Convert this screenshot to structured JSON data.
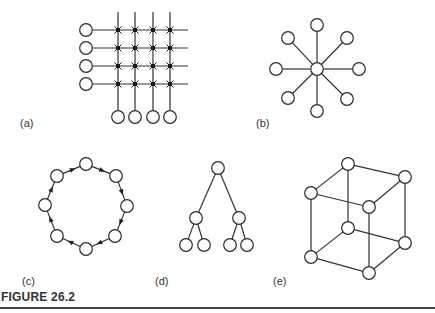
{
  "figure": {
    "caption": "FIGURE 26.2",
    "cutoff_text": "",
    "panels": [
      {
        "id": "a",
        "label": "(a)",
        "type": "crossbar-switch",
        "rows": 4,
        "columns": 4
      },
      {
        "id": "b",
        "label": "(b)",
        "type": "star",
        "outer_nodes": 8
      },
      {
        "id": "c",
        "label": "(c)",
        "type": "ring",
        "nodes": 8,
        "direction": "clockwise"
      },
      {
        "id": "d",
        "label": "(d)",
        "type": "binary-tree",
        "levels": 3,
        "nodes": 7
      },
      {
        "id": "e",
        "label": "(e)",
        "type": "hypercube",
        "dimension": 3,
        "nodes": 8
      }
    ]
  },
  "geometry": {
    "crossbar": {
      "row_y": [
        30,
        48,
        66,
        84
      ],
      "col_x": [
        118,
        135,
        153,
        170
      ],
      "left_node_x": 86,
      "bottom_node_y": 117,
      "line_top": 12,
      "line_right": 188
    },
    "star": {
      "center": [
        317,
        69
      ],
      "outer": [
        [
          317,
          25
        ],
        [
          347,
          38
        ],
        [
          359,
          69
        ],
        [
          347,
          99
        ],
        [
          317,
          111
        ],
        [
          288,
          98
        ],
        [
          276,
          69
        ],
        [
          288,
          38
        ]
      ]
    },
    "ring": {
      "nodes": [
        [
          86,
          164
        ],
        [
          116,
          176
        ],
        [
          127,
          206
        ],
        [
          115,
          236
        ],
        [
          86,
          249
        ],
        [
          57,
          236
        ],
        [
          45,
          205
        ],
        [
          57,
          176
        ]
      ]
    },
    "tree": {
      "nodes": [
        [
          218,
          168
        ],
        [
          196,
          218
        ],
        [
          239,
          218
        ],
        [
          186,
          245
        ],
        [
          204,
          245
        ],
        [
          230,
          245
        ],
        [
          247,
          245
        ]
      ],
      "edges": [
        [
          0,
          1
        ],
        [
          0,
          2
        ],
        [
          1,
          3
        ],
        [
          1,
          4
        ],
        [
          2,
          5
        ],
        [
          2,
          6
        ]
      ]
    },
    "cube": {
      "nodes": [
        [
          348,
          164
        ],
        [
          405,
          177
        ],
        [
          311,
          193
        ],
        [
          369,
          207
        ],
        [
          348,
          228
        ],
        [
          405,
          243
        ],
        [
          311,
          257
        ],
        [
          369,
          273
        ]
      ],
      "edges": [
        [
          0,
          1
        ],
        [
          0,
          2
        ],
        [
          1,
          3
        ],
        [
          2,
          3
        ],
        [
          4,
          5
        ],
        [
          4,
          6
        ],
        [
          5,
          7
        ],
        [
          6,
          7
        ],
        [
          0,
          4
        ],
        [
          1,
          5
        ],
        [
          2,
          6
        ],
        [
          3,
          7
        ]
      ]
    },
    "node_radius": 6.3
  },
  "style": {
    "stroke": "#333333",
    "caption_color": "#333333"
  }
}
